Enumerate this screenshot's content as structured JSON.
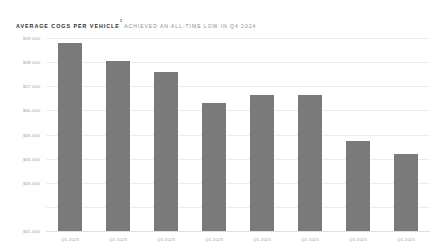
{
  "header": {
    "title_main": "Average COGS per Vehicle",
    "title_superscript": "1",
    "title_subtitle": "achieved an all-time low in Q4 2024"
  },
  "colors": {
    "bar": "#7a7a7a",
    "gridline": "#ededed",
    "axis_text": "#9a9a9a",
    "title_text": "#2f2f2f",
    "subtitle_text": "#8d8d8d",
    "background": "#ffffff"
  },
  "chart_data": {
    "type": "bar",
    "xlabel": "",
    "ylabel": "",
    "categories": [
      "Q1 2023",
      "Q2 2023",
      "Q3 2023",
      "Q4 2023",
      "Q1 2024",
      "Q2 2024",
      "Q3 2024",
      "Q4 2024"
    ],
    "values": [
      38800,
      38050,
      37600,
      36300,
      36650,
      36650,
      34750,
      34200
    ],
    "ylim": [
      31000,
      39000
    ],
    "yticks": [
      31000,
      32000,
      33000,
      34000,
      35000,
      36000,
      37000,
      38000,
      39000
    ],
    "ytick_labels": [
      "$39,000",
      "$38,000",
      "$37,000",
      "$36,000",
      "$35,000",
      "$34,000",
      "$33,000",
      "$31,000"
    ],
    "ytick_label_values": [
      39000,
      38000,
      37000,
      36000,
      35000,
      34000,
      33000,
      31000
    ],
    "grid": true,
    "legend": "none",
    "series": [
      {
        "name": "Average COGS per Vehicle",
        "values": [
          38800,
          38050,
          37600,
          36300,
          36650,
          36650,
          34750,
          34200
        ]
      }
    ]
  }
}
